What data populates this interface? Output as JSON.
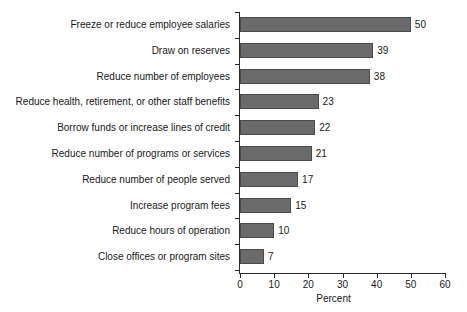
{
  "chart_data": {
    "type": "bar",
    "orientation": "horizontal",
    "title": "",
    "xlabel": "Percent",
    "ylabel": "",
    "xlim": [
      0,
      60
    ],
    "xticks": [
      0,
      10,
      20,
      30,
      40,
      50,
      60
    ],
    "grid": false,
    "legend": null,
    "bar_color": "#6b6b6b",
    "bar_edge_color": "#4a4a4a",
    "background_color": "#ffffff",
    "text_color": "#1a1a1a",
    "categories": [
      "Freeze or reduce employee salaries",
      "Draw on reserves",
      "Reduce number of employees",
      "Reduce health, retirement, or other staff benefits",
      "Borrow funds or increase lines of credit",
      "Reduce number of programs or services",
      "Reduce number of people served",
      "Increase program fees",
      "Reduce hours of operation",
      "Close offices or program sites"
    ],
    "values": [
      50,
      39,
      38,
      23,
      22,
      21,
      17,
      15,
      10,
      7
    ],
    "data_labels": [
      "50",
      "39",
      "38",
      "23",
      "22",
      "21",
      "17",
      "15",
      "10",
      "7"
    ],
    "xtick_labels": [
      "0",
      "10",
      "20",
      "30",
      "40",
      "50",
      "60"
    ]
  }
}
